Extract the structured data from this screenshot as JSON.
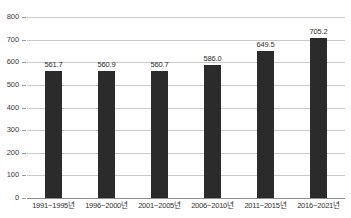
{
  "chart_data": {
    "type": "bar",
    "title": "",
    "subtitle": "",
    "xlabel": "",
    "ylabel": "",
    "ylim": [
      0,
      800
    ],
    "ytick_interval": 100,
    "grid": true,
    "legend": "none",
    "orientation": "vertical",
    "bar_color": "#2b2b2b",
    "gridline_color": "#c9c9c9",
    "axis_color": "#8d8d8d",
    "categories": [
      "1991~1995년",
      "1996~2000년",
      "2001~2005년",
      "2006~2010년",
      "2011~2015년",
      "2016~2021년"
    ],
    "values": [
      561.7,
      560.9,
      560.7,
      586.0,
      649.5,
      705.2
    ],
    "value_labels": [
      "561.7",
      "560.9",
      "560.7",
      "586.0",
      "649.5",
      "705.2"
    ],
    "yticks": [
      800,
      700,
      600,
      500,
      400,
      300,
      200,
      100,
      0
    ],
    "ytick_labels": [
      "800",
      "700",
      "600",
      "500",
      "400",
      "300",
      "200",
      "100",
      "0"
    ]
  }
}
